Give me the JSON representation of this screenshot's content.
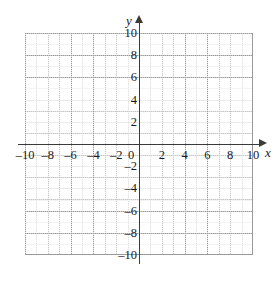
{
  "figure": {
    "kind": "cartesian-coordinate-grid",
    "background_color": "#ffffff"
  },
  "chart_data": {
    "type": "scatter",
    "title": "",
    "subtitle": "",
    "xlabel": "x",
    "ylabel": "y",
    "xlim": [
      -10,
      10
    ],
    "ylim": [
      -10,
      10
    ],
    "grid": true,
    "grid_major_step": 2,
    "grid_minor_step": 1,
    "grid_major_color": "#9a9a9a",
    "grid_minor_color": "#c6c6c6",
    "axis_color": "#3a3a3a",
    "legend": "none",
    "series": [],
    "annotations": [],
    "xticks": [
      -10,
      -8,
      -6,
      -4,
      -2,
      0,
      2,
      4,
      6,
      8,
      10
    ],
    "yticks": [
      -10,
      -8,
      -6,
      -4,
      -2,
      0,
      2,
      4,
      6,
      8,
      10
    ],
    "xticklabels": [
      "–10",
      "–8",
      "–6",
      "–4",
      "–2",
      "0",
      "2",
      "4",
      "6",
      "8",
      "10"
    ],
    "yticklabels": [
      "–10",
      "–8",
      "–6",
      "–4",
      "–2",
      "",
      "2",
      "4",
      "6",
      "8",
      "10"
    ]
  },
  "axes": {
    "x_label": "x",
    "y_label": "y",
    "origin_label": "0",
    "x_arrow": "arrow-right",
    "y_arrow": "arrow-up"
  },
  "x_ticks": [
    {
      "value": -10,
      "label": "–10"
    },
    {
      "value": -8,
      "label": "–8"
    },
    {
      "value": -6,
      "label": "–6"
    },
    {
      "value": -4,
      "label": "–4"
    },
    {
      "value": -2,
      "label": "–2"
    },
    {
      "value": 0,
      "label": "0"
    },
    {
      "value": 2,
      "label": "2"
    },
    {
      "value": 4,
      "label": "4"
    },
    {
      "value": 6,
      "label": "6"
    },
    {
      "value": 8,
      "label": "8"
    },
    {
      "value": 10,
      "label": "10"
    }
  ],
  "y_ticks": [
    {
      "value": 10,
      "label": "10"
    },
    {
      "value": 8,
      "label": "8"
    },
    {
      "value": 6,
      "label": "6"
    },
    {
      "value": 4,
      "label": "4"
    },
    {
      "value": 2,
      "label": "2"
    },
    {
      "value": -2,
      "label": "–2"
    },
    {
      "value": -4,
      "label": "–4"
    },
    {
      "value": -6,
      "label": "–6"
    },
    {
      "value": -8,
      "label": "–8"
    },
    {
      "value": -10,
      "label": "–10"
    }
  ]
}
